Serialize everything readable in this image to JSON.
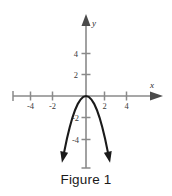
{
  "figure": {
    "caption": "Figure 1",
    "top_clipped_text": "",
    "axis_color": "#8a8a8a",
    "curve_color": "#1a1a1a",
    "label_color": "#3b3b3b",
    "background": "#ffffff"
  },
  "chart_data": {
    "type": "line",
    "title": "Figure 1",
    "subtitle": "",
    "xlabel": "x",
    "ylabel": "y",
    "grid": false,
    "legend_position": "none",
    "xlim": [
      -6,
      6.5
    ],
    "ylim": [
      -6.5,
      5.5
    ],
    "x_ticks": [
      -4,
      -2,
      2,
      4
    ],
    "x_tick_labels": [
      "-4",
      "-2",
      "2",
      "4"
    ],
    "y_ticks": [
      4,
      2,
      -2,
      -4
    ],
    "y_tick_labels": [
      "4",
      "2",
      "-2",
      "-4"
    ],
    "equation": "y = -1.3x^2",
    "vertex": [
      0,
      0
    ],
    "opens": "down",
    "arrows": [
      "left-end",
      "right-end"
    ],
    "series": [
      {
        "name": "parabola",
        "x": [
          -2.0,
          -1.75,
          -1.5,
          -1.25,
          -1.0,
          -0.75,
          -0.5,
          -0.25,
          0,
          0.25,
          0.5,
          0.75,
          1.0,
          1.25,
          1.5,
          1.75,
          2.0
        ],
        "y": [
          -5.2,
          -3.98,
          -2.93,
          -2.03,
          -1.3,
          -0.73,
          -0.33,
          -0.08,
          0,
          -0.08,
          -0.33,
          -0.73,
          -1.3,
          -2.03,
          -2.93,
          -3.98,
          -5.2
        ]
      }
    ],
    "annotations": [
      {
        "text": "y",
        "role": "y-axis-name"
      },
      {
        "text": "x",
        "role": "x-axis-name"
      }
    ]
  },
  "labels": {
    "x_neg4": "-4",
    "x_neg2": "-2",
    "x_pos2": "2",
    "x_pos4": "4",
    "y_pos4": "4",
    "y_pos2": "2",
    "y_neg2": "-2",
    "y_neg4": "-4",
    "axis_x": "x",
    "axis_y": "y"
  }
}
